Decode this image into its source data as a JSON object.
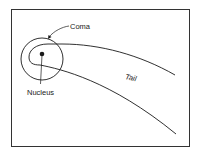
{
  "diagram": {
    "labels": {
      "coma": "Coma",
      "nucleus": "Nucleus",
      "tail": "Tail"
    },
    "colors": {
      "stroke": "#1a1a1a",
      "background": "#ffffff",
      "frame": "#333333"
    }
  }
}
